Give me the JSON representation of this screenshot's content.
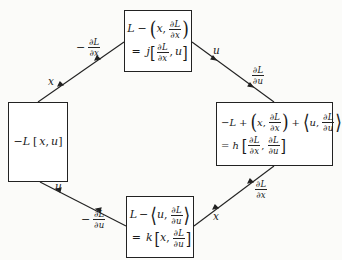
{
  "diagram": {
    "type": "Legendre transform cycle diagram",
    "nodes": {
      "left": {
        "expression": "-L[x, u]",
        "text": "−L [x, u]"
      },
      "top": {
        "line1": {
          "lead": "L",
          "op": "−",
          "pair": [
            "x",
            "∂L/∂x"
          ]
        },
        "line2": {
          "eq": "=",
          "func": "j",
          "args": [
            "∂L/∂x",
            "u"
          ]
        },
        "text": "L − (x, ∂L/∂x) = j[∂L/∂x, u]"
      },
      "right": {
        "line1": {
          "lead": "−L",
          "terms": [
            [
              "x",
              "∂L/∂x"
            ],
            [
              "u",
              "∂L/∂u"
            ]
          ]
        },
        "line2": {
          "eq": "=",
          "func": "h",
          "args": [
            "∂L/∂x",
            "∂L/∂u"
          ]
        },
        "text": "−L + (x, ∂L/∂x) + ⟨u, ∂L/∂u⟩ = h[∂L/∂x, ∂L/∂u]"
      },
      "bottom": {
        "line1": {
          "lead": "L",
          "op": "−",
          "pair": [
            "u",
            "∂L/∂u"
          ]
        },
        "line2": {
          "eq": "=",
          "func": "k",
          "args": [
            "x",
            "∂L/∂u"
          ]
        },
        "text": "L − ⟨u, ∂L/∂u⟩ = k[x, ∂L/∂u]"
      }
    },
    "edges": [
      {
        "from": "left",
        "to": "top",
        "labels": {
          "near_left": "x",
          "near_top": "−∂L/∂x"
        }
      },
      {
        "from": "top",
        "to": "right",
        "labels": {
          "near_top": "u",
          "near_right": "∂L/∂u"
        }
      },
      {
        "from": "left",
        "to": "bottom",
        "labels": {
          "near_left": "u",
          "near_bottom": "−∂L/∂u"
        }
      },
      {
        "from": "bottom",
        "to": "right",
        "labels": {
          "near_bottom": "x",
          "near_right": "∂L/∂x"
        }
      }
    ],
    "symbols": {
      "minus": "−",
      "plus": "+",
      "equals": "=",
      "comma": ",",
      "dL": "∂L",
      "dx": "∂x",
      "du": "∂u",
      "lparen": "(",
      "rparen": ")",
      "langle": "⟨",
      "rangle": "⟩",
      "lbrack": "[",
      "rbrack": "]",
      "x": "x",
      "u": "u",
      "L": "L",
      "negL": "−L",
      "j": "j",
      "h": "h",
      "k": "k"
    },
    "colors": {
      "line": "#222222",
      "background": "#fbfbf9",
      "text": "#1a1a1a"
    }
  }
}
